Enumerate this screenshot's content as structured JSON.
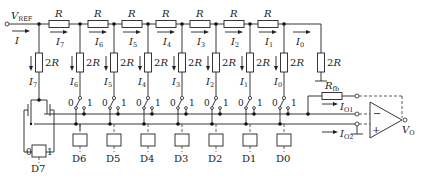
{
  "diagram": {
    "type": "R-2R ladder DAC with op-amp",
    "input": {
      "label": "V",
      "sub": "REF",
      "current": "I"
    },
    "series_resistor_label": "R",
    "shunt_resistor_label": "2R",
    "feedback_resistor": {
      "label": "R",
      "sub": "fb"
    },
    "series_currents": [
      {
        "label": "I",
        "sub": "7"
      },
      {
        "label": "I",
        "sub": "6"
      },
      {
        "label": "I",
        "sub": "5"
      },
      {
        "label": "I",
        "sub": "4"
      },
      {
        "label": "I",
        "sub": "3"
      },
      {
        "label": "I",
        "sub": "2"
      },
      {
        "label": "I",
        "sub": "1"
      },
      {
        "label": "I",
        "sub": "0"
      }
    ],
    "branch_currents": [
      {
        "label": "I",
        "sub": "7"
      },
      {
        "label": "I",
        "sub": "6"
      },
      {
        "label": "I",
        "sub": "5"
      },
      {
        "label": "I",
        "sub": "4"
      },
      {
        "label": "I",
        "sub": "3"
      },
      {
        "label": "I",
        "sub": "2"
      },
      {
        "label": "I",
        "sub": "1"
      },
      {
        "label": "I",
        "sub": "0"
      }
    ],
    "switch_positions": {
      "zero": "0",
      "one": "1"
    },
    "bits": [
      "D7",
      "D6",
      "D5",
      "D4",
      "D3",
      "D2",
      "D1",
      "D0"
    ],
    "outputs": {
      "io1": {
        "label": "I",
        "sub": "O1"
      },
      "io2": {
        "label": "I",
        "sub": "O2"
      },
      "vo": {
        "label": "V",
        "sub": "O"
      }
    },
    "opamp": {
      "minus": "−",
      "plus": "+"
    }
  }
}
